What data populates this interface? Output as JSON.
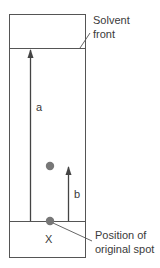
{
  "diagram": {
    "labels": {
      "solvent_front_line1": "Solvent",
      "solvent_front_line2": "front",
      "distance_a": "a",
      "distance_b": "b",
      "origin_mark": "X",
      "origin_line1": "Position of",
      "origin_line2": "original spot"
    },
    "colors": {
      "line": "#555555",
      "spot": "#777777",
      "text": "#3a3a3a"
    }
  }
}
